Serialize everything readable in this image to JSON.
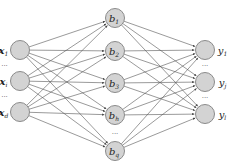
{
  "diagram": {
    "type": "neural-network",
    "colors": {
      "node_fill": "#d3d3d3",
      "node_stroke": "#8a8a8a",
      "edge": "#555555"
    },
    "layers": [
      {
        "name": "input",
        "x": 20,
        "nodes": [
          {
            "label": "x",
            "sub": "1",
            "y": 50,
            "bold": true
          },
          {
            "label": "x",
            "sub": "i",
            "y": 81,
            "bold": true
          },
          {
            "label": "x",
            "sub": "d",
            "y": 112,
            "bold": true
          }
        ],
        "ellipses": [
          66,
          97
        ],
        "label_side": "left"
      },
      {
        "name": "hidden",
        "x": 115,
        "nodes": [
          {
            "label": "b",
            "sub": "1",
            "y": 18
          },
          {
            "label": "b",
            "sub": "2",
            "y": 51
          },
          {
            "label": "b",
            "sub": "3",
            "y": 83
          },
          {
            "label": "b",
            "sub": "h",
            "y": 115
          },
          {
            "label": "b",
            "sub": "q",
            "y": 151
          }
        ],
        "ellipses": [
          134
        ],
        "label_side": "inside"
      },
      {
        "name": "output",
        "x": 205,
        "nodes": [
          {
            "label": "y",
            "sub": "1",
            "y": 50
          },
          {
            "label": "y",
            "sub": "j",
            "y": 82
          },
          {
            "label": "y",
            "sub": "l",
            "y": 114
          }
        ],
        "ellipses": [
          66,
          98
        ],
        "label_side": "right"
      }
    ]
  }
}
